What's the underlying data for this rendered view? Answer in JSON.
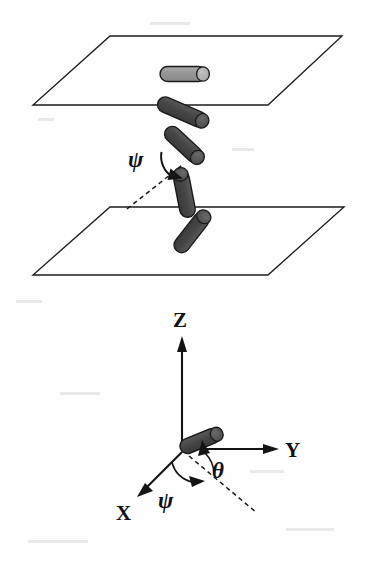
{
  "figure": {
    "title_visible": false,
    "background_color": "#fefefe",
    "ink_color": "#1a1a1a",
    "rod_fill_dark": "#4a4a4a",
    "rod_fill_light": "#9a9a9a",
    "rod_cap_light": "#b4b4b4",
    "rod_outline": "#1a1a1a"
  },
  "labels": {
    "psi_upper": "ψ",
    "psi_lower": "ψ",
    "theta": "θ",
    "axis_z": "Z",
    "axis_y": "Y",
    "axis_x": "X"
  },
  "upper_panel": {
    "name": "two-plane-rod-chain",
    "planes": [
      {
        "name": "upper-plane",
        "points": "110,36 342,36 268,105 33,105"
      },
      {
        "name": "lower-plane",
        "points": "110,207 344,207 268,275 33,275"
      }
    ],
    "rods": [
      {
        "name": "rod-1-in-upper-plane",
        "x1": 162,
        "y1": 74,
        "x2": 204,
        "y2": 74,
        "width": 14,
        "shade": "light"
      },
      {
        "name": "rod-2",
        "x1": 161,
        "y1": 103,
        "x2": 203,
        "y2": 121,
        "width": 15,
        "shade": "dark"
      },
      {
        "name": "rod-3",
        "x1": 167,
        "y1": 129,
        "x2": 200,
        "y2": 160,
        "width": 15,
        "shade": "dark"
      },
      {
        "name": "rod-4",
        "x1": 188,
        "y1": 176,
        "x2": 181,
        "y2": 212,
        "width": 15,
        "shade": "dark"
      },
      {
        "name": "rod-5",
        "x1": 203,
        "y1": 218,
        "x2": 180,
        "y2": 247,
        "width": 15,
        "shade": "dark"
      }
    ],
    "dashed_reference_line": {
      "name": "psi-reference-dashed",
      "x1": 127,
      "y1": 209,
      "x2": 184,
      "y2": 164
    },
    "psi_label_pos": {
      "x": 131,
      "y": 161
    }
  },
  "lower_panel": {
    "name": "coordinate-frame",
    "origin": {
      "x": 182,
      "y": 449
    },
    "axes": [
      {
        "name": "axis-z",
        "label": "Z",
        "tip_x": 182,
        "tip_y": 338,
        "label_x": 175,
        "label_y": 325
      },
      {
        "name": "axis-y",
        "label": "Y",
        "tip_x": 277,
        "tip_y": 449,
        "label_x": 286,
        "label_y": 457
      },
      {
        "name": "axis-x",
        "label": "X",
        "tip_x": 139,
        "tip_y": 494,
        "label_x": 117,
        "label_y": 517
      }
    ],
    "rod": {
      "name": "orientation-rod",
      "x1": 183,
      "y1": 449,
      "x2": 218,
      "y2": 434,
      "width": 14,
      "shade": "dark"
    },
    "dashed_projection": {
      "name": "projection-dashed",
      "x1": 188,
      "y1": 455,
      "x2": 257,
      "y2": 512
    },
    "theta_label_pos": {
      "x": 213,
      "y": 471
    },
    "psi_label_pos": {
      "x": 160,
      "y": 503
    }
  }
}
